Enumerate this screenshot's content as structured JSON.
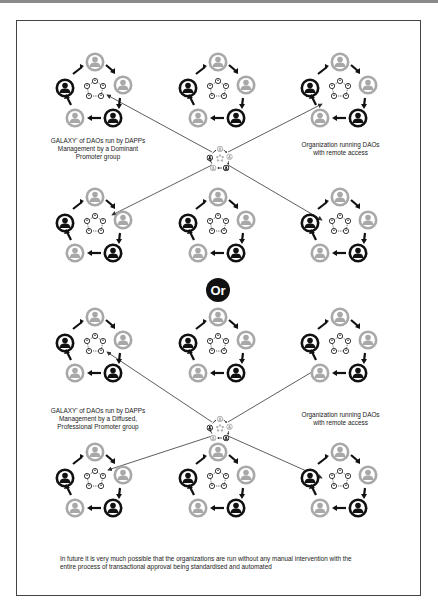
{
  "labels": {
    "top_left": "GALAXY' of DAOs run by DAPPs Management by a Dominant Promoter group",
    "top_right": "Organization running DAOs with remote access",
    "bottom_left": "GALAXY' of DAOs run by DAPPs Management by a Diffused, Professional Promoter group",
    "bottom_right": "Organization running DAOs with remote access"
  },
  "label_lines": {
    "top_left": [
      "GALAXY' of DAOs run by DAPPs",
      "Management by a Dominant",
      "Promoter group"
    ],
    "top_right": [
      "Organization running DAOs",
      "with remote access"
    ],
    "bottom_left": [
      "GALAXY' of DAOs run by DAPPs",
      "Management by a Diffused,",
      "Professional Promoter group"
    ],
    "bottom_right": [
      "Organization running DAOs",
      "with remote access"
    ]
  },
  "separator": "Or",
  "footer_lines": [
    "In future it is very much possible that the organizations are run without any manual intervention with the",
    "entire process of transactional approval being standardised and automated"
  ],
  "colors": {
    "dark_person": "#111111",
    "light_person": "#a8a8a8",
    "line": "#333333",
    "frame": "#444444"
  },
  "sections": [
    {
      "name": "dominant-promoter",
      "hub": [
        220,
        158
      ],
      "clusters": [
        [
          95,
          90
        ],
        [
          218,
          90
        ],
        [
          340,
          90
        ],
        [
          95,
          225
        ],
        [
          218,
          225
        ],
        [
          340,
          225
        ]
      ]
    },
    {
      "name": "diffused-promoter",
      "hub": [
        220,
        428
      ],
      "clusters": [
        [
          95,
          345
        ],
        [
          218,
          345
        ],
        [
          340,
          345
        ],
        [
          95,
          480
        ],
        [
          218,
          480
        ],
        [
          340,
          480
        ]
      ]
    }
  ]
}
